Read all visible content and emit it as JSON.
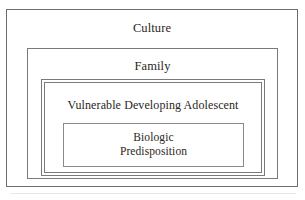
{
  "figure": {
    "type": "nested-ecological-model-diagram",
    "background_color": "#ffffff",
    "text_color": "#2a2622",
    "line_color": "#7a7a7a"
  },
  "levels": [
    {
      "id": "culture",
      "label": "Culture",
      "depth": 1,
      "border_style": "single"
    },
    {
      "id": "family",
      "label": "Family",
      "depth": 2,
      "border_style": "single"
    },
    {
      "id": "adolescent",
      "label": "Vulnerable Developing Adolescent",
      "depth": 3,
      "border_style": "double"
    },
    {
      "id": "biologic",
      "label": "Biologic\nPredisposition",
      "depth": 4,
      "border_style": "single"
    }
  ]
}
